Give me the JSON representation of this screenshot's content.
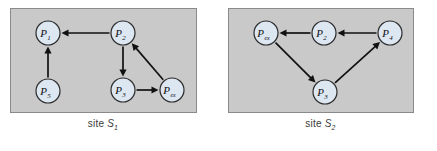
{
  "figure": {
    "background": "#ffffff",
    "panel_fill": "#c9c9c9",
    "panel_border": "#8a8a8a",
    "node_fill": "#dce7f2",
    "node_stroke": "#2b2b2b",
    "edge_color": "#111111"
  },
  "panels": [
    {
      "id": "site-1",
      "caption_prefix": "site ",
      "caption_symbol": "S",
      "caption_subscript": "1",
      "nodes": [
        {
          "id": "P1",
          "label": "P",
          "subscript": "1",
          "cx": 48,
          "cy": 33,
          "r": 12
        },
        {
          "id": "P2",
          "label": "P",
          "subscript": "2",
          "cx": 123,
          "cy": 33,
          "r": 12
        },
        {
          "id": "P5",
          "label": "P",
          "subscript": "5",
          "cx": 48,
          "cy": 91,
          "r": 12
        },
        {
          "id": "P3",
          "label": "P",
          "subscript": "3",
          "cx": 123,
          "cy": 90,
          "r": 12
        },
        {
          "id": "Pex",
          "label": "P",
          "subscript": "ex",
          "cx": 172,
          "cy": 90,
          "r": 12
        }
      ],
      "edges": [
        {
          "from": "P2",
          "to": "P1"
        },
        {
          "from": "P5",
          "to": "P1"
        },
        {
          "from": "P2",
          "to": "P3"
        },
        {
          "from": "P3",
          "to": "Pex"
        },
        {
          "from": "Pex",
          "to": "P2"
        }
      ]
    },
    {
      "id": "site-2",
      "caption_prefix": "site ",
      "caption_symbol": "S",
      "caption_subscript": "2",
      "nodes": [
        {
          "id": "Pex",
          "label": "P",
          "subscript": "ex",
          "cx": 266,
          "cy": 33,
          "r": 12
        },
        {
          "id": "P2",
          "label": "P",
          "subscript": "2",
          "cx": 324,
          "cy": 33,
          "r": 12
        },
        {
          "id": "P4",
          "label": "P",
          "subscript": "4",
          "cx": 390,
          "cy": 33,
          "r": 12
        },
        {
          "id": "P3",
          "label": "P",
          "subscript": "3",
          "cx": 325,
          "cy": 92,
          "r": 12
        }
      ],
      "edges": [
        {
          "from": "P4",
          "to": "P2"
        },
        {
          "from": "P2",
          "to": "Pex"
        },
        {
          "from": "Pex",
          "to": "P3"
        },
        {
          "from": "P3",
          "to": "P4"
        }
      ]
    }
  ],
  "layout": {
    "panel1": {
      "x": 10,
      "y": 8,
      "w": 186,
      "h": 104
    },
    "panel2": {
      "x": 228,
      "y": 8,
      "w": 185,
      "h": 104
    },
    "caption1": {
      "x": 10,
      "y": 118,
      "w": 186
    },
    "caption2": {
      "x": 228,
      "y": 118,
      "w": 185
    }
  }
}
